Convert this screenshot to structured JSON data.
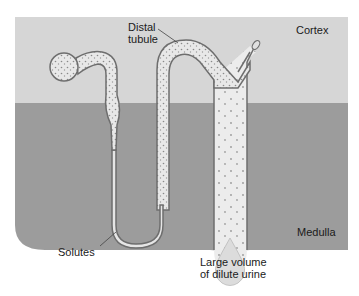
{
  "figure": {
    "caption_fragment": "(b) ... to lose water ...",
    "regions": {
      "cortex": {
        "label": "Cortex",
        "color": "#d6d6d6"
      },
      "medulla": {
        "label": "Medulla",
        "color": "#9c9c9c"
      }
    },
    "labels": {
      "distal_tubule_line1": "Distal",
      "distal_tubule_line2": "tubule",
      "solutes": "Solutes",
      "urine_line1": "Large volume",
      "urine_line2": "of dilute urine"
    },
    "colors": {
      "tubule_fill": "#e9e9e9",
      "tubule_outline": "#6e6e6e",
      "solute_dots": "#8a8a8a",
      "background": "#ffffff"
    }
  }
}
